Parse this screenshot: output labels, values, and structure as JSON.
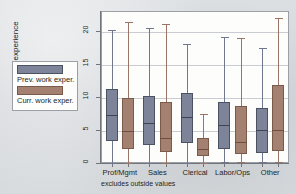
{
  "figure": {
    "y_axis_title": "Years of experience",
    "footnote": "excludes outside values"
  },
  "legend": {
    "items": [
      {
        "key": "prev",
        "label": "Prev. work exper.",
        "color": "#7d8499"
      },
      {
        "key": "curr",
        "label": "Curr. work exper.",
        "color": "#a3806f"
      }
    ]
  },
  "chart_data": {
    "type": "box",
    "title": "",
    "xlabel": "",
    "ylabel": "Years of experience",
    "ylim": [
      0,
      22.5
    ],
    "yticks": [
      0,
      5,
      10,
      15,
      20
    ],
    "ytick_labels": [
      "0",
      "5",
      "10",
      "15",
      "20"
    ],
    "grid": true,
    "legend_position": "left-outside",
    "note": "excludes outside values",
    "categories": [
      "Prof/Mgmt",
      "Sales",
      "Clerical",
      "Labor/Ops",
      "Other"
    ],
    "series": [
      {
        "name": "Prev. work exper.",
        "color": "#7d8499",
        "boxes": [
          {
            "category": "Prof/Mgmt",
            "whisker_low": 0.0,
            "q1": 3.4,
            "median": 7.2,
            "q3": 11.2,
            "whisker_high": 20.2
          },
          {
            "category": "Sales",
            "whisker_low": 0.0,
            "q1": 2.7,
            "median": 6.1,
            "q3": 10.1,
            "whisker_high": 20.5
          },
          {
            "category": "Clerical",
            "whisker_low": 0.0,
            "q1": 3.1,
            "median": 7.0,
            "q3": 10.6,
            "whisker_high": 18.0
          },
          {
            "category": "Labor/Ops",
            "whisker_low": 0.1,
            "q1": 2.1,
            "median": 5.7,
            "q3": 9.2,
            "whisker_high": 19.1
          },
          {
            "category": "Other",
            "whisker_low": 0.1,
            "q1": 1.5,
            "median": 5.0,
            "q3": 8.4,
            "whisker_high": 17.5
          }
        ]
      },
      {
        "name": "Curr. work exper.",
        "color": "#a3806f",
        "boxes": [
          {
            "category": "Prof/Mgmt",
            "whisker_low": 0.0,
            "q1": 2.1,
            "median": 4.9,
            "q3": 9.9,
            "whisker_high": 21.3
          },
          {
            "category": "Sales",
            "whisker_low": 0.0,
            "q1": 1.7,
            "median": 3.8,
            "q3": 9.3,
            "whisker_high": 21.0
          },
          {
            "category": "Clerical",
            "whisker_low": 0.0,
            "q1": 1.1,
            "median": 2.1,
            "q3": 3.8,
            "whisker_high": 7.5
          },
          {
            "category": "Labor/Ops",
            "whisker_low": 0.1,
            "q1": 1.3,
            "median": 3.2,
            "q3": 8.6,
            "whisker_high": 18.9
          },
          {
            "category": "Other",
            "whisker_low": 0.1,
            "q1": 1.8,
            "median": 5.0,
            "q3": 11.8,
            "whisker_high": 21.9
          }
        ]
      }
    ]
  }
}
